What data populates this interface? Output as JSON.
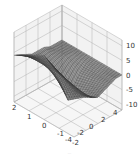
{
  "chart_data": {
    "type": "surface3d",
    "title": "",
    "caption": "...",
    "xlabel": "",
    "ylabel": "",
    "zlabel": "",
    "x_ticks": [
      -4,
      -2,
      0,
      2,
      4
    ],
    "y_ticks": [
      -2,
      -1,
      0,
      1,
      2
    ],
    "z_ticks": [
      -10,
      -5,
      0,
      5,
      10
    ],
    "xlim": [
      -4,
      4
    ],
    "ylim": [
      -2,
      2
    ],
    "zlim": [
      -12,
      12
    ],
    "grid": true,
    "surface_color": "#333333",
    "pane_color": "#f2f2f2",
    "grid_color": "#b0b0b0",
    "surface_grid": {
      "x": [
        -4,
        -3,
        -2,
        -1,
        0,
        1,
        2,
        3,
        4
      ],
      "y": [
        -2,
        -1,
        0,
        1,
        2
      ],
      "z": [
        [
          4,
          2,
          0,
          -2,
          -3,
          -2,
          -1,
          0,
          0
        ],
        [
          7,
          4,
          1,
          -3,
          -6,
          -4,
          -2,
          -1,
          0
        ],
        [
          10,
          6,
          2,
          -4,
          -10,
          -6,
          -3,
          -1,
          0
        ],
        [
          7,
          5,
          2,
          0,
          -2,
          -1,
          0,
          0,
          0
        ],
        [
          4,
          3,
          2,
          1,
          1,
          1,
          0,
          0,
          0
        ]
      ]
    }
  }
}
